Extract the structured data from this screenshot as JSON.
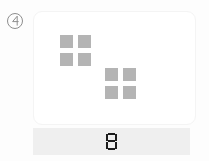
{
  "page": {
    "background_color": "#fdfdfd"
  },
  "badge": {
    "icon_name": "circled-four-icon",
    "label": "4",
    "border_color": "#8e8e8e"
  },
  "card": {
    "background_color": "#ffffff",
    "border_color": "#f4f4f4",
    "square_color": "#b4b4b4",
    "square_total": 8,
    "groups": [
      {
        "name": "upper-left-group",
        "count": 4,
        "squares": [
          {
            "id": "a1"
          },
          {
            "id": "a2"
          },
          {
            "id": "a3"
          },
          {
            "id": "a4"
          }
        ]
      },
      {
        "name": "lower-right-group",
        "count": 4,
        "squares": [
          {
            "id": "b1"
          },
          {
            "id": "b2"
          },
          {
            "id": "b3"
          },
          {
            "id": "b4"
          }
        ]
      }
    ]
  },
  "footer": {
    "background_color": "#efefef",
    "value": "8",
    "digit_color": "#1c1c1c"
  }
}
